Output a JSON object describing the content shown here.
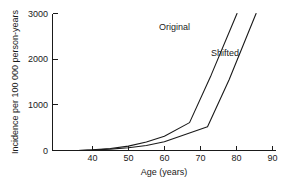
{
  "chart_data": {
    "type": "line",
    "title": "",
    "subtitle": "",
    "xlabel": "Age (years)",
    "ylabel": "Incidence per 100 000 person-years",
    "xlim": [
      28.9,
      90.9
    ],
    "ylim": [
      0,
      3000
    ],
    "xticks": [
      40,
      50,
      60,
      70,
      80,
      90
    ],
    "xtick_labels": [
      "40",
      "50",
      "60",
      "70",
      "80",
      "90"
    ],
    "yticks": [
      0,
      1000,
      2000,
      3000
    ],
    "ytick_labels": [
      "0",
      "1000",
      "2000",
      "3000"
    ],
    "grid": false,
    "legend_position": "inline-annotation",
    "series": [
      {
        "name": "Original",
        "label": "Original",
        "x": [
          36,
          40,
          45,
          50,
          55,
          60,
          67,
          73,
          80.2
        ],
        "values": [
          0,
          15,
          45,
          95,
          185,
          310,
          610,
          1650,
          3000
        ]
      },
      {
        "name": "Shifted",
        "label": "Shifted",
        "x": [
          36,
          40,
          45,
          50,
          55,
          60,
          65,
          72,
          78,
          85.5
        ],
        "values": [
          0,
          10,
          30,
          60,
          110,
          190,
          330,
          520,
          1550,
          3000
        ]
      }
    ],
    "annotations": [
      {
        "text": "Original",
        "x": 58.5,
        "y": 2650
      },
      {
        "text": "Shifted",
        "x": 73.0,
        "y": 2080
      }
    ]
  },
  "figure": {
    "background_color": "#ffffff",
    "line_color": "#1a1a1a"
  }
}
